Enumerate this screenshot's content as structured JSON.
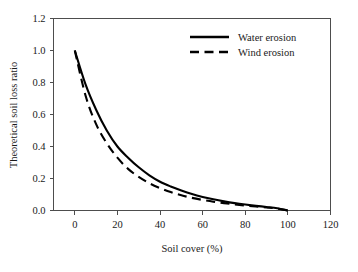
{
  "chart_data": {
    "type": "line",
    "title": "",
    "xlabel": "Soil cover (%)",
    "ylabel": "Theoretical soil loss ratio",
    "xlim": [
      -10,
      120
    ],
    "ylim": [
      0.0,
      1.2
    ],
    "xticks": [
      "0",
      "20",
      "40",
      "60",
      "80",
      "100",
      "120"
    ],
    "xtick_values": [
      0,
      20,
      40,
      60,
      80,
      100,
      120
    ],
    "yticks": [
      "0.0",
      "0.2",
      "0.4",
      "0.6",
      "0.8",
      "1.0",
      "1.2"
    ],
    "ytick_values": [
      0.0,
      0.2,
      0.4,
      0.6,
      0.8,
      1.0,
      1.2
    ],
    "grid": false,
    "legend_position": "top-right",
    "series": [
      {
        "name": "Water erosion",
        "style": "solid",
        "color": "#000000",
        "x": [
          0,
          5,
          10,
          15,
          20,
          25,
          30,
          35,
          40,
          45,
          50,
          55,
          60,
          65,
          70,
          75,
          80,
          85,
          90,
          95,
          100
        ],
        "values": [
          1.0,
          0.79,
          0.63,
          0.5,
          0.4,
          0.33,
          0.27,
          0.22,
          0.18,
          0.15,
          0.125,
          0.103,
          0.085,
          0.07,
          0.057,
          0.046,
          0.037,
          0.029,
          0.022,
          0.014,
          0.0
        ]
      },
      {
        "name": "Wind erosion",
        "style": "dashed",
        "color": "#000000",
        "x": [
          0,
          5,
          10,
          15,
          20,
          25,
          30,
          35,
          40,
          45,
          50,
          55,
          60,
          65,
          70,
          75,
          80,
          85,
          90,
          95,
          100
        ],
        "values": [
          1.0,
          0.72,
          0.54,
          0.42,
          0.33,
          0.26,
          0.21,
          0.17,
          0.14,
          0.115,
          0.095,
          0.079,
          0.066,
          0.055,
          0.046,
          0.038,
          0.031,
          0.025,
          0.019,
          0.012,
          0.0
        ]
      }
    ]
  },
  "legend": {
    "entries": [
      {
        "label": "Water erosion"
      },
      {
        "label": "Wind erosion"
      }
    ]
  }
}
